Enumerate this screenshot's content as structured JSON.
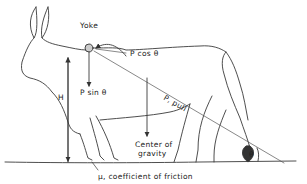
{
  "diagram": {
    "labels": {
      "yoke": "Yoke",
      "p_cos": "P cos θ",
      "p_sin": "P sin θ",
      "p_pull": "P, pull",
      "height": "H",
      "cg_line1": "Center of",
      "cg_line2": "gravity",
      "theta": "θ",
      "friction": "μ, coefficient of friction"
    },
    "colors": {
      "line": "#3a3a3a",
      "background": "#ffffff"
    }
  }
}
